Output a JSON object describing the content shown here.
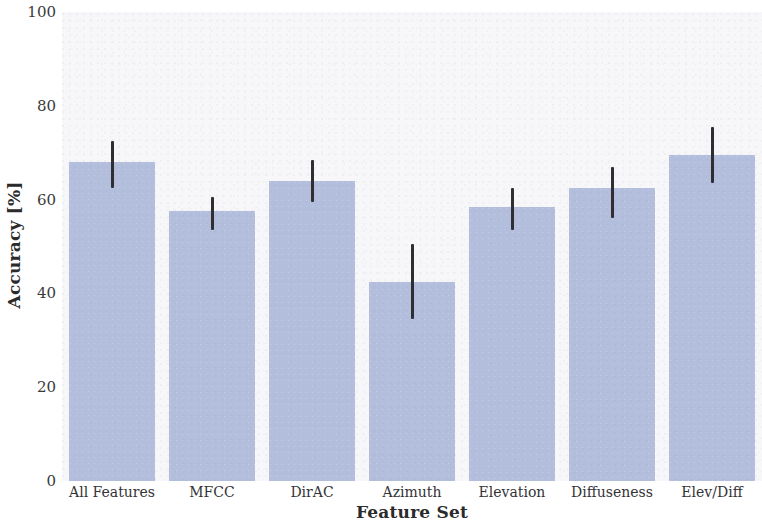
{
  "chart_data": {
    "type": "bar",
    "title": "",
    "xlabel": "Feature Set",
    "ylabel": "Accuracy [%]",
    "categories": [
      "All Features",
      "MFCC",
      "DirAC",
      "Azimuth",
      "Elevation",
      "Diffuseness",
      "Elev/Diff"
    ],
    "values": [
      68,
      57.5,
      64,
      42.5,
      58.5,
      62.5,
      69.5
    ],
    "errors_low": [
      62.5,
      53.5,
      59.5,
      34.5,
      53.5,
      56,
      63.5
    ],
    "errors_high": [
      72.5,
      60.5,
      68.5,
      50.5,
      62.5,
      67,
      75.5
    ],
    "ylim": [
      0,
      100
    ],
    "yticks": [
      0,
      20,
      40,
      60,
      80,
      100
    ],
    "ytick_labels": [
      "0",
      "20",
      "40",
      "60",
      "80",
      "100"
    ],
    "grid": false,
    "legend": "none",
    "bar_color": "#b3bddc",
    "error_color": "#2f2f33",
    "plot_background": "#f7f7f9",
    "figure_background": "#ffffff"
  }
}
